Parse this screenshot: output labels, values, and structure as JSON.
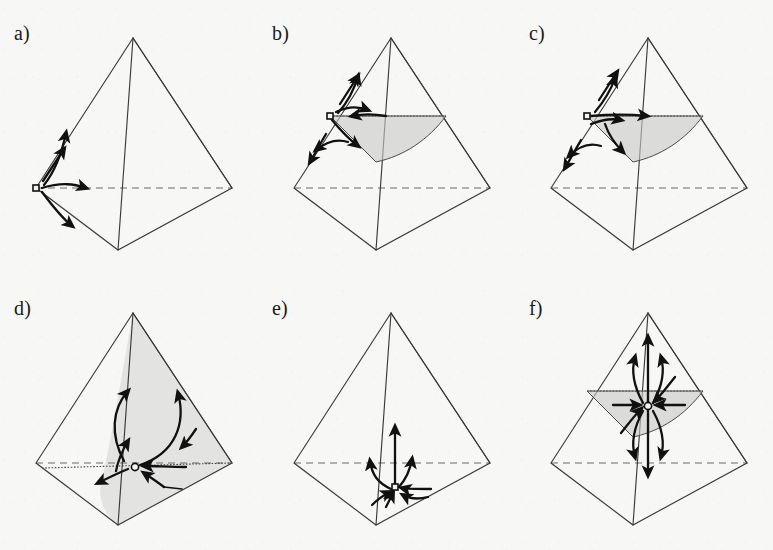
{
  "figure": {
    "type": "scientific-diagram",
    "background_color": "#f7f7f5",
    "line_color": "#3a3a3a",
    "shade_color": "#c9c9c9",
    "arrow_color": "#111111",
    "columns": 3,
    "rows": 2
  },
  "panels": [
    {
      "id": "a",
      "label": "a)",
      "origin": {
        "x": 0,
        "y": 0
      },
      "geometry": {
        "apex": {
          "x": 133,
          "y": 38
        },
        "left": {
          "x": 36,
          "y": 188
        },
        "right": {
          "x": 232,
          "y": 188
        },
        "front": {
          "x": 118,
          "y": 250
        }
      },
      "hidden_edge": "left-right",
      "shaded_faces": [],
      "equilibrium_points": [
        {
          "x": 36,
          "y": 188,
          "kind": "saddle",
          "marker": "open-square"
        }
      ],
      "flow_arrows": [
        {
          "name": "up-along-left-edge",
          "direction": "up-right"
        },
        {
          "name": "curve-to-upper-edge",
          "direction": "up-right"
        },
        {
          "name": "curve-to-interior-right",
          "direction": "right"
        },
        {
          "name": "curve-down-to-front-edge",
          "direction": "down-right"
        }
      ]
    },
    {
      "id": "b",
      "label": "b)",
      "origin": {
        "x": 258,
        "y": 0
      },
      "geometry": {
        "apex": {
          "x": 133,
          "y": 38
        },
        "left": {
          "x": 36,
          "y": 188
        },
        "right": {
          "x": 232,
          "y": 188
        },
        "front": {
          "x": 118,
          "y": 250
        }
      },
      "hidden_edge": "left-right",
      "shaded_faces": [
        {
          "name": "upper-interior-sail",
          "style": "curved-triangle"
        }
      ],
      "equilibrium_points": [
        {
          "x": 72,
          "y": 116,
          "kind": "saddle",
          "marker": "open-square"
        }
      ],
      "flow_arrows": [
        {
          "name": "up-along-left-edge",
          "direction": "up-right"
        },
        {
          "name": "curve-up-out-of-plane",
          "direction": "up"
        },
        {
          "name": "inward-along-top-dotted-edge",
          "direction": "left"
        },
        {
          "name": "curve-down-into-shade",
          "direction": "down-right"
        },
        {
          "name": "curve-down-left-edge",
          "direction": "down-left"
        }
      ]
    },
    {
      "id": "c",
      "label": "c)",
      "origin": {
        "x": 515,
        "y": 0
      },
      "geometry": {
        "apex": {
          "x": 133,
          "y": 38
        },
        "left": {
          "x": 36,
          "y": 188
        },
        "right": {
          "x": 232,
          "y": 188
        },
        "front": {
          "x": 118,
          "y": 250
        }
      },
      "hidden_edge": "left-right",
      "shaded_faces": [
        {
          "name": "upper-interior-sail",
          "style": "curved-triangle"
        }
      ],
      "equilibrium_points": [
        {
          "x": 72,
          "y": 116,
          "kind": "saddle",
          "marker": "open-square"
        }
      ],
      "flow_arrows": [
        {
          "name": "up-along-left-edge",
          "direction": "up-right"
        },
        {
          "name": "curve-up-out-of-plane",
          "direction": "up"
        },
        {
          "name": "outward-along-top-dotted-edge",
          "direction": "right"
        },
        {
          "name": "short-right-into-shade",
          "direction": "right"
        },
        {
          "name": "curve-down-into-shade",
          "direction": "down-right"
        },
        {
          "name": "curve-down-left-edge",
          "direction": "down-left"
        }
      ]
    },
    {
      "id": "d",
      "label": "d)",
      "origin": {
        "x": 0,
        "y": 275
      },
      "geometry": {
        "apex": {
          "x": 133,
          "y": 38
        },
        "left": {
          "x": 36,
          "y": 188
        },
        "right": {
          "x": 232,
          "y": 188
        },
        "front": {
          "x": 118,
          "y": 250
        }
      },
      "hidden_edge": "left-right",
      "shaded_faces": [
        {
          "name": "right-face-large",
          "style": "full-face"
        },
        {
          "name": "lower-curved-wedge",
          "style": "curved-wedge"
        }
      ],
      "equilibrium_points": [
        {
          "x": 133,
          "y": 191,
          "kind": "saddle",
          "marker": "open-circle"
        }
      ],
      "flow_arrows": [
        {
          "name": "left-loop-upward",
          "direction": "up"
        },
        {
          "name": "right-loop-upward",
          "direction": "up"
        },
        {
          "name": "right-edge-inward",
          "direction": "down-left"
        },
        {
          "name": "left-edge-upward",
          "direction": "up-right"
        },
        {
          "name": "inflow-from-right-along-dotted",
          "direction": "left"
        },
        {
          "name": "outflow-down-left",
          "direction": "down-left"
        },
        {
          "name": "inflow-from-lower-right",
          "direction": "up-left"
        }
      ]
    },
    {
      "id": "e",
      "label": "e)",
      "origin": {
        "x": 258,
        "y": 275
      },
      "geometry": {
        "apex": {
          "x": 133,
          "y": 38
        },
        "left": {
          "x": 36,
          "y": 188
        },
        "right": {
          "x": 232,
          "y": 188
        },
        "front": {
          "x": 118,
          "y": 250
        }
      },
      "hidden_edge": "left-right",
      "shaded_faces": [],
      "equilibrium_points": [
        {
          "x": 137,
          "y": 212,
          "kind": "saddle",
          "marker": "filled-square"
        }
      ],
      "flow_arrows": [
        {
          "name": "central-vertical-up",
          "direction": "up"
        },
        {
          "name": "left-branch-up",
          "direction": "up"
        },
        {
          "name": "right-branch-up",
          "direction": "up"
        },
        {
          "name": "inflow-from-right",
          "direction": "left"
        },
        {
          "name": "inflow-from-below",
          "direction": "up"
        }
      ]
    },
    {
      "id": "f",
      "label": "f)",
      "origin": {
        "x": 515,
        "y": 275
      },
      "geometry": {
        "apex": {
          "x": 133,
          "y": 38
        },
        "left": {
          "x": 36,
          "y": 188
        },
        "right": {
          "x": 232,
          "y": 188
        },
        "front": {
          "x": 118,
          "y": 250
        }
      },
      "hidden_edge": "left-right",
      "shaded_faces": [
        {
          "name": "upper-interior-sail",
          "style": "curved-triangle"
        }
      ],
      "equilibrium_points": [
        {
          "x": 133,
          "y": 130,
          "kind": "source-sink",
          "marker": "open-circle"
        }
      ],
      "flow_arrows": [
        {
          "name": "up-vertical-long",
          "direction": "up"
        },
        {
          "name": "up-left-fan",
          "direction": "up"
        },
        {
          "name": "up-right-fan",
          "direction": "up"
        },
        {
          "name": "down-vertical-long",
          "direction": "down"
        },
        {
          "name": "down-left-fan",
          "direction": "down"
        },
        {
          "name": "down-right-fan",
          "direction": "down"
        },
        {
          "name": "inward-from-left",
          "direction": "right"
        },
        {
          "name": "inward-from-right",
          "direction": "left"
        },
        {
          "name": "inward-from-above",
          "direction": "down"
        },
        {
          "name": "inward-from-below",
          "direction": "up"
        }
      ]
    }
  ]
}
